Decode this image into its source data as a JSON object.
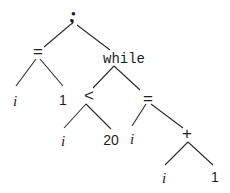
{
  "diagram": {
    "type": "abstract-syntax-tree",
    "nodes": {
      "root": {
        "label": ";",
        "x": 73,
        "y": 18
      },
      "assign1": {
        "label": "=",
        "x": 38,
        "y": 52
      },
      "while": {
        "label": "while",
        "x": 124,
        "y": 58
      },
      "a1_i": {
        "label": "i",
        "x": 15,
        "y": 101
      },
      "a1_1": {
        "label": "1",
        "x": 63,
        "y": 101
      },
      "lt": {
        "label": "<",
        "x": 89,
        "y": 96
      },
      "assign2": {
        "label": "=",
        "x": 148,
        "y": 100
      },
      "lt_i": {
        "label": "i",
        "x": 63,
        "y": 141
      },
      "lt_20": {
        "label": "20",
        "x": 110,
        "y": 141
      },
      "a2_i": {
        "label": "i",
        "x": 132,
        "y": 139
      },
      "plus": {
        "label": "+",
        "x": 187,
        "y": 134
      },
      "plus_i": {
        "label": "i",
        "x": 164,
        "y": 178
      },
      "plus_1": {
        "label": "1",
        "x": 215,
        "y": 178
      }
    },
    "edges": [
      [
        "root",
        "assign1"
      ],
      [
        "root",
        "while"
      ],
      [
        "assign1",
        "a1_i"
      ],
      [
        "assign1",
        "a1_1"
      ],
      [
        "while",
        "lt"
      ],
      [
        "while",
        "assign2"
      ],
      [
        "lt",
        "lt_i"
      ],
      [
        "lt",
        "lt_20"
      ],
      [
        "assign2",
        "a2_i"
      ],
      [
        "assign2",
        "plus"
      ],
      [
        "plus",
        "plus_i"
      ],
      [
        "plus",
        "plus_1"
      ]
    ]
  }
}
